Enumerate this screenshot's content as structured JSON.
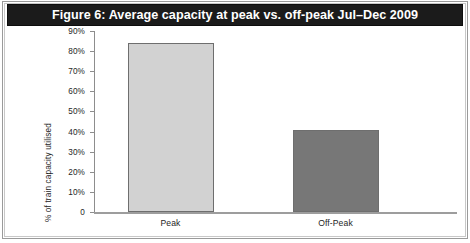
{
  "figure": {
    "title": "Figure 6: Average capacity at peak vs. off-peak Jul–Dec 2009",
    "title_bar_color": "#1b1b1b",
    "title_text_color": "#ffffff",
    "background_color": "#ffffff"
  },
  "chart_data": {
    "type": "bar",
    "title": "Figure 6: Average capacity at peak vs. off-peak Jul–Dec 2009",
    "categories": [
      "Peak",
      "Off-Peak"
    ],
    "values": [
      84,
      41
    ],
    "series": [
      {
        "name": "Average capacity utilised",
        "values": [
          84,
          41
        ],
        "colors": [
          "#d2d2d2",
          "#777777"
        ]
      }
    ],
    "xlabel": "",
    "ylabel": "% of train capacity utilised",
    "ylim": [
      0,
      90
    ],
    "ytick_step": 10,
    "ytick_labels": [
      "90%",
      "80%",
      "70%",
      "60%",
      "50%",
      "40%",
      "30%",
      "20%",
      "10%",
      "0"
    ],
    "ytick_values": [
      90,
      80,
      70,
      60,
      50,
      40,
      30,
      20,
      10,
      0
    ],
    "grid": false,
    "legend": "none",
    "bar_colors": {
      "peak": "#d2d2d2",
      "off_peak": "#777777",
      "bar_border": "#6e6e6e"
    },
    "axis_color": "#8d8d8d"
  }
}
